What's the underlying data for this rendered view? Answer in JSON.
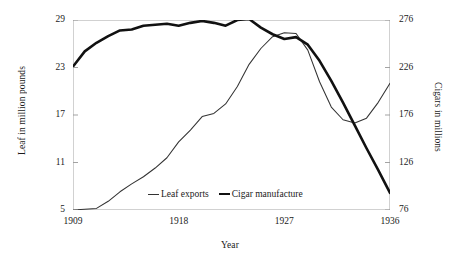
{
  "chart_data": {
    "type": "line",
    "title": "",
    "xlabel": "Year",
    "ylabel": "Leaf in million pounds",
    "y2label": "Cigars in millions",
    "grid": false,
    "legend_position": "inside-bottom-center",
    "xlim": [
      1909,
      1936
    ],
    "xticks": [
      "1909",
      "1918",
      "1927",
      "1936"
    ],
    "ylim": [
      5,
      29
    ],
    "yticks": [
      "5",
      "11",
      "17",
      "23",
      "29"
    ],
    "y2lim": [
      76,
      276
    ],
    "y2ticks": [
      "76",
      "126",
      "176",
      "226",
      "276"
    ],
    "x": [
      1909,
      1910,
      1911,
      1912,
      1913,
      1914,
      1915,
      1916,
      1917,
      1918,
      1919,
      1920,
      1921,
      1922,
      1923,
      1924,
      1925,
      1926,
      1927,
      1928,
      1929,
      1930,
      1931,
      1932,
      1933,
      1934,
      1935,
      1936
    ],
    "series": [
      {
        "name": "Leaf exports",
        "axis": "left",
        "style": "thin",
        "color": "#333333",
        "values": [
          5.0,
          5.1,
          5.2,
          6.1,
          7.3,
          8.3,
          9.2,
          10.3,
          11.6,
          13.6,
          15.1,
          16.8,
          17.2,
          18.4,
          20.6,
          23.4,
          25.4,
          26.9,
          27.4,
          27.3,
          25.2,
          21.2,
          18.0,
          16.4,
          16.0,
          16.6,
          18.6,
          21.0
        ]
      },
      {
        "name": "Cigar manufacture",
        "axis": "right",
        "style": "thick",
        "color": "#111111",
        "values": [
          227.0,
          243.0,
          252.0,
          259.0,
          265.0,
          266.0,
          270.0,
          271.0,
          272.0,
          270.0,
          273.0,
          275.0,
          273.0,
          270.0,
          276.0,
          277.0,
          268.0,
          261.0,
          256.0,
          258.0,
          250.0,
          233.0,
          212.0,
          189.0,
          165.0,
          141.0,
          118.0,
          94.0
        ]
      }
    ]
  },
  "axes": {
    "left_title": "Leaf in million pounds",
    "right_title": "Cigars in millions",
    "x_title": "Year"
  },
  "legend": {
    "items": [
      {
        "label": "Leaf exports"
      },
      {
        "label": "Cigar manufacture"
      }
    ]
  }
}
